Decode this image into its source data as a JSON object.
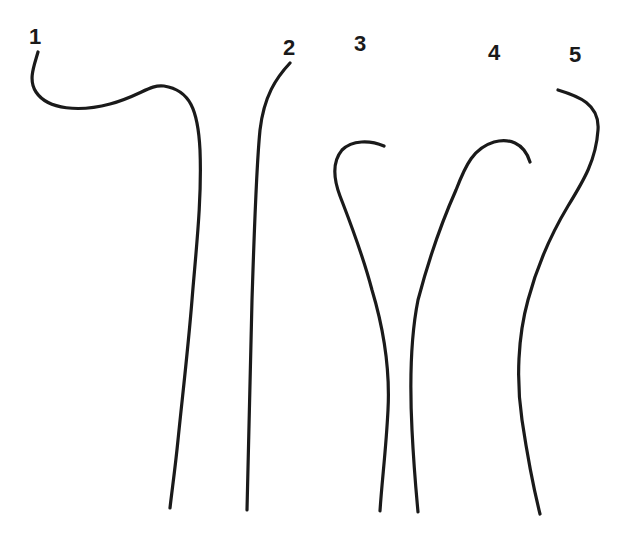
{
  "diagram": {
    "type": "line-drawing",
    "stroke_color": "#1a1a1a",
    "background": "#ffffff",
    "curves": [
      {
        "id": "1",
        "label": "1",
        "label_pos": [
          28,
          26
        ]
      },
      {
        "id": "2",
        "label": "2",
        "label_pos": [
          281,
          37
        ]
      },
      {
        "id": "3",
        "label": "3",
        "label_pos": [
          353,
          33
        ]
      },
      {
        "id": "4",
        "label": "4",
        "label_pos": [
          488,
          42
        ]
      },
      {
        "id": "5",
        "label": "5",
        "label_pos": [
          569,
          43
        ]
      }
    ]
  }
}
